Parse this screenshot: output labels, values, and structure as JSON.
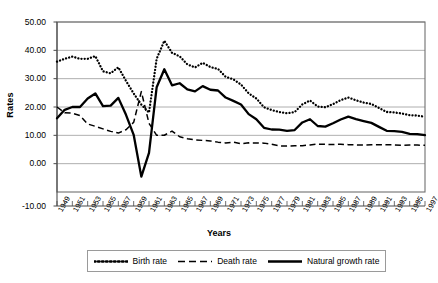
{
  "chart_data": {
    "type": "line",
    "title": "",
    "xlabel": "Years",
    "ylabel": "Rates",
    "ylim": [
      -10,
      50
    ],
    "xlim": [
      1949,
      1997
    ],
    "grid": true,
    "legend_position": "bottom",
    "ytick_labels": [
      "50.00",
      "40.00",
      "30.00",
      "20.00",
      "10.00",
      "0.00",
      "-10.00"
    ],
    "ytick_values": [
      50,
      40,
      30,
      20,
      10,
      0,
      -10
    ],
    "xtick_labels": [
      "1949",
      "1951",
      "1953",
      "1955",
      "1957",
      "1959",
      "1961",
      "1963",
      "1965",
      "1967",
      "1969",
      "1971",
      "1973",
      "1975",
      "1977",
      "1979",
      "1981",
      "1983",
      "1985",
      "1987",
      "1989",
      "1991",
      "1993",
      "1995",
      "1997"
    ],
    "x": [
      1949,
      1950,
      1951,
      1952,
      1953,
      1954,
      1955,
      1956,
      1957,
      1958,
      1959,
      1960,
      1961,
      1962,
      1963,
      1964,
      1965,
      1966,
      1967,
      1968,
      1969,
      1970,
      1971,
      1972,
      1973,
      1974,
      1975,
      1976,
      1977,
      1978,
      1979,
      1980,
      1981,
      1982,
      1983,
      1984,
      1985,
      1986,
      1987,
      1988,
      1989,
      1990,
      1991,
      1992,
      1993,
      1994,
      1995,
      1996,
      1997
    ],
    "series": [
      {
        "name": "Birth rate",
        "style": "dotted",
        "color": "#000000",
        "values": [
          36.0,
          37.0,
          37.8,
          37.0,
          37.0,
          37.97,
          32.6,
          31.9,
          34.03,
          29.22,
          24.78,
          20.86,
          18.02,
          37.01,
          43.37,
          39.14,
          37.88,
          35.05,
          33.96,
          35.59,
          34.11,
          33.43,
          30.65,
          29.77,
          27.93,
          24.82,
          23.01,
          19.91,
          18.93,
          18.25,
          17.82,
          18.21,
          20.91,
          22.28,
          20.19,
          19.9,
          21.04,
          22.43,
          23.33,
          22.37,
          21.58,
          21.06,
          19.68,
          18.24,
          18.09,
          17.7,
          17.12,
          16.98,
          16.57
        ]
      },
      {
        "name": "Death rate",
        "style": "dashed",
        "color": "#000000",
        "values": [
          20.0,
          18.0,
          17.8,
          17.0,
          14.0,
          13.18,
          12.28,
          11.4,
          10.8,
          11.98,
          14.59,
          25.43,
          14.24,
          10.02,
          10.04,
          11.5,
          9.5,
          8.83,
          8.43,
          8.21,
          8.03,
          7.6,
          7.32,
          7.61,
          7.04,
          7.34,
          7.32,
          7.25,
          6.87,
          6.25,
          6.21,
          6.34,
          6.36,
          6.6,
          6.9,
          6.82,
          6.78,
          6.86,
          6.72,
          6.64,
          6.54,
          6.67,
          6.7,
          6.64,
          6.64,
          6.49,
          6.57,
          6.56,
          6.51
        ]
      },
      {
        "name": "Natural growth rate",
        "style": "solid",
        "color": "#000000",
        "values": [
          16.0,
          19.0,
          20.0,
          20.0,
          23.0,
          24.79,
          20.32,
          20.5,
          23.23,
          17.24,
          10.19,
          -4.57,
          3.78,
          26.99,
          33.33,
          27.64,
          28.38,
          26.22,
          25.53,
          27.38,
          26.08,
          25.83,
          23.33,
          22.16,
          20.89,
          17.48,
          15.69,
          12.66,
          12.06,
          12.0,
          11.61,
          11.87,
          14.55,
          15.68,
          13.29,
          13.08,
          14.26,
          15.57,
          16.61,
          15.73,
          15.04,
          14.39,
          12.98,
          11.6,
          11.45,
          11.21,
          10.55,
          10.42,
          10.06
        ]
      }
    ]
  },
  "axis": {
    "ylabel_title": "Rates",
    "xlabel_title": "Years"
  },
  "legend": {
    "items": [
      {
        "label": "Birth rate",
        "style": "dotted"
      },
      {
        "label": "Death rate",
        "style": "dashed"
      },
      {
        "label": "Natural growth rate",
        "style": "solid"
      }
    ]
  }
}
